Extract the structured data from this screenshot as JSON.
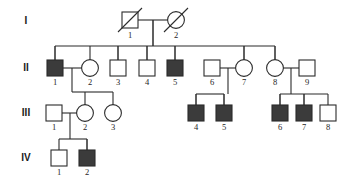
{
  "figure": {
    "kind": "pedigree-chart",
    "width": 346,
    "height": 194,
    "background_color": "#ffffff",
    "line_color": "#2b2b2b",
    "affected_fill_color": "#3b3b3b",
    "unaffected_fill_color": "#ffffff"
  },
  "generation_labels": [
    {
      "label": "I",
      "y": 24
    },
    {
      "label": "II",
      "y": 71
    },
    {
      "label": "III",
      "y": 116
    },
    {
      "label": "IV",
      "y": 161
    }
  ],
  "legend_semantics": {
    "square": "male",
    "circle": "female",
    "filled": "affected",
    "open": "unaffected",
    "slash": "deceased"
  },
  "individuals": [
    {
      "id": "I-1",
      "number": "1",
      "generation": "I",
      "sex": "male",
      "affected": false,
      "deceased": true,
      "cx": 130,
      "cy": 20
    },
    {
      "id": "I-2",
      "number": "2",
      "generation": "I",
      "sex": "female",
      "affected": false,
      "deceased": true,
      "cx": 176,
      "cy": 20
    },
    {
      "id": "II-1",
      "number": "1",
      "generation": "II",
      "sex": "male",
      "affected": true,
      "deceased": false,
      "cx": 55,
      "cy": 68
    },
    {
      "id": "II-2",
      "number": "2",
      "generation": "II",
      "sex": "female",
      "affected": false,
      "deceased": false,
      "cx": 90,
      "cy": 68
    },
    {
      "id": "II-3",
      "number": "3",
      "generation": "II",
      "sex": "male",
      "affected": false,
      "deceased": false,
      "cx": 118,
      "cy": 68
    },
    {
      "id": "II-4",
      "number": "4",
      "generation": "II",
      "sex": "male",
      "affected": false,
      "deceased": false,
      "cx": 147,
      "cy": 68
    },
    {
      "id": "II-5",
      "number": "5",
      "generation": "II",
      "sex": "male",
      "affected": true,
      "deceased": false,
      "cx": 175,
      "cy": 68
    },
    {
      "id": "II-6",
      "number": "6",
      "generation": "II",
      "sex": "male",
      "affected": false,
      "deceased": false,
      "cx": 212,
      "cy": 68
    },
    {
      "id": "II-7",
      "number": "7",
      "generation": "II",
      "sex": "female",
      "affected": false,
      "deceased": false,
      "cx": 244,
      "cy": 68
    },
    {
      "id": "II-8",
      "number": "8",
      "generation": "II",
      "sex": "female",
      "affected": false,
      "deceased": false,
      "cx": 275,
      "cy": 68
    },
    {
      "id": "II-9",
      "number": "9",
      "generation": "II",
      "sex": "male",
      "affected": false,
      "deceased": false,
      "cx": 307,
      "cy": 68
    },
    {
      "id": "III-1",
      "number": "1",
      "generation": "III",
      "sex": "male",
      "affected": false,
      "deceased": false,
      "cx": 54,
      "cy": 113
    },
    {
      "id": "III-2",
      "number": "2",
      "generation": "III",
      "sex": "female",
      "affected": false,
      "deceased": false,
      "cx": 85,
      "cy": 113
    },
    {
      "id": "III-3",
      "number": "3",
      "generation": "III",
      "sex": "female",
      "affected": false,
      "deceased": false,
      "cx": 113,
      "cy": 113
    },
    {
      "id": "III-4",
      "number": "4",
      "generation": "III",
      "sex": "male",
      "affected": true,
      "deceased": false,
      "cx": 196,
      "cy": 113
    },
    {
      "id": "III-5",
      "number": "5",
      "generation": "III",
      "sex": "male",
      "affected": true,
      "deceased": false,
      "cx": 224,
      "cy": 113
    },
    {
      "id": "III-6",
      "number": "6",
      "generation": "III",
      "sex": "male",
      "affected": true,
      "deceased": false,
      "cx": 280,
      "cy": 113
    },
    {
      "id": "III-7",
      "number": "7",
      "generation": "III",
      "sex": "male",
      "affected": true,
      "deceased": false,
      "cx": 304,
      "cy": 113
    },
    {
      "id": "III-8",
      "number": "8",
      "generation": "III",
      "sex": "male",
      "affected": false,
      "deceased": false,
      "cx": 328,
      "cy": 113
    },
    {
      "id": "IV-1",
      "number": "1",
      "generation": "IV",
      "sex": "male",
      "affected": false,
      "deceased": false,
      "cx": 59,
      "cy": 158
    },
    {
      "id": "IV-2",
      "number": "2",
      "generation": "IV",
      "sex": "male",
      "affected": true,
      "deceased": false,
      "cx": 87,
      "cy": 158
    }
  ],
  "matings": [
    {
      "partners": [
        "I-1",
        "I-2"
      ],
      "children": [
        "II-1",
        "II-2",
        "II-3",
        "II-4",
        "II-5",
        "II-7",
        "II-8"
      ]
    },
    {
      "partners": [
        "II-1",
        "II-2"
      ],
      "children": [
        "III-2",
        "III-3"
      ]
    },
    {
      "partners": [
        "II-6",
        "II-7"
      ],
      "children": [
        "III-4",
        "III-5"
      ]
    },
    {
      "partners": [
        "II-8",
        "II-9"
      ],
      "children": [
        "III-6",
        "III-7",
        "III-8"
      ]
    },
    {
      "partners": [
        "III-1",
        "III-2"
      ],
      "children": [
        "IV-1",
        "IV-2"
      ]
    }
  ],
  "counts": {
    "generations": 4,
    "individuals": 21,
    "affected": 8
  }
}
